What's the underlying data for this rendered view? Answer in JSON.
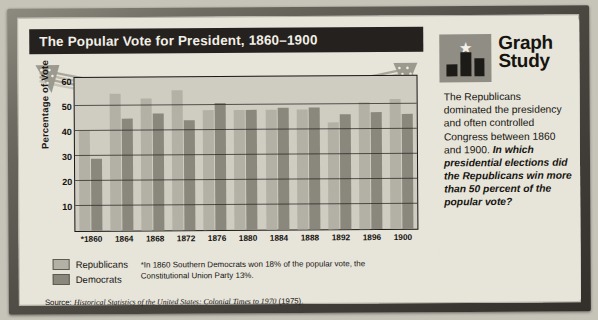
{
  "chart_panel": {
    "title": "The Popular Vote for President, 1860–1900",
    "ylabel": "Percentage of Vote",
    "legend": {
      "republicans": "Republicans",
      "democrats": "Democrats"
    },
    "footnote": "*In 1860 Southern Democrats won 18% of the popular vote, the Constitutional Union Party 13%.",
    "source_prefix": "Source:",
    "source_title": "Historical Statistics of the United States: Colonial Times to 1970",
    "source_year": "(1975)."
  },
  "study_panel": {
    "icon_star": "★",
    "title_line1": "Graph",
    "title_line2": "Study",
    "body": "The Republicans dominated the presidency and often controlled Congress between 1860 and 1900. ",
    "question": "In which presidential elections did the Republicans win more than 50 percent of the popular vote?"
  },
  "colors": {
    "republican_bar": "#b3b0a6",
    "democrat_bar": "#8a877d",
    "title_bar": "#24211e",
    "plot_bg": "#cfccc2",
    "paper": "#e7e4da"
  },
  "chart_data": {
    "type": "bar",
    "title": "The Popular Vote for President, 1860–1900",
    "xlabel": "",
    "ylabel": "Percentage of Vote",
    "ylim": [
      0,
      62
    ],
    "yticks": [
      60,
      50,
      40,
      30,
      20,
      10
    ],
    "grid": true,
    "legend_position": "bottom-left",
    "categories": [
      "*1860",
      "1864",
      "1868",
      "1872",
      "1876",
      "1880",
      "1884",
      "1888",
      "1892",
      "1896",
      "1900"
    ],
    "series": [
      {
        "name": "Republicans",
        "values": [
          40,
          55,
          53,
          56,
          48,
          48,
          48,
          48,
          43,
          51,
          52
        ]
      },
      {
        "name": "Democrats",
        "values": [
          29,
          45,
          47,
          44,
          51,
          48,
          49,
          49,
          46,
          47,
          46
        ]
      }
    ],
    "annotations": [
      "*In 1860 Southern Democrats won 18% of the popular vote, the Constitutional Union Party 13%."
    ]
  }
}
